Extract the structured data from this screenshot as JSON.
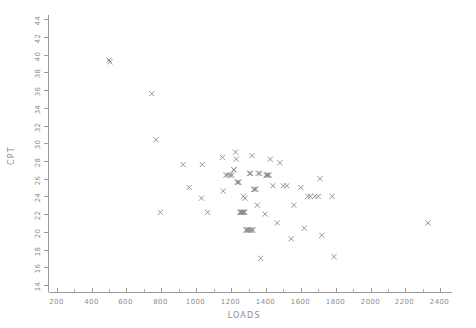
{
  "chart_data": {
    "type": "scatter",
    "title": "",
    "xlabel": "LOADS",
    "ylabel": "CPT",
    "xlim": [
      150,
      2530
    ],
    "ylim": [
      13.2,
      44.6
    ],
    "grid": false,
    "legend": null,
    "marker": "x",
    "marker_color": "#8a8a8a",
    "xticks": [
      200,
      400,
      600,
      800,
      1000,
      1200,
      1400,
      1600,
      1800,
      2000,
      2200,
      2400
    ],
    "xtick_labels": [
      "200",
      "400",
      "600",
      "800",
      "1000",
      "1200",
      "1400",
      "1600",
      "1800",
      "2000",
      "2200",
      "2400"
    ],
    "x_minor_step": 100,
    "yticks": [
      14,
      16,
      18,
      20,
      22,
      24,
      26,
      28,
      30,
      32,
      34,
      36,
      38,
      40,
      42,
      44
    ],
    "ytick_labels": [
      "14",
      "16",
      "18",
      "20",
      "22",
      "24",
      "26",
      "28",
      "30",
      "32",
      "34",
      "36",
      "38",
      "40",
      "42",
      "44"
    ],
    "y_tick_rotation": 90,
    "points": [
      {
        "x": 500,
        "y": 39.4
      },
      {
        "x": 505,
        "y": 39.2
      },
      {
        "x": 745,
        "y": 35.6
      },
      {
        "x": 770,
        "y": 30.4
      },
      {
        "x": 795,
        "y": 22.2
      },
      {
        "x": 925,
        "y": 27.6
      },
      {
        "x": 960,
        "y": 25.0
      },
      {
        "x": 1030,
        "y": 23.8
      },
      {
        "x": 1035,
        "y": 27.6
      },
      {
        "x": 1065,
        "y": 22.2
      },
      {
        "x": 1150,
        "y": 28.4
      },
      {
        "x": 1155,
        "y": 24.6
      },
      {
        "x": 1170,
        "y": 26.4
      },
      {
        "x": 1180,
        "y": 26.4
      },
      {
        "x": 1195,
        "y": 26.4
      },
      {
        "x": 1205,
        "y": 26.4
      },
      {
        "x": 1215,
        "y": 27.0
      },
      {
        "x": 1218,
        "y": 27.0
      },
      {
        "x": 1225,
        "y": 29.0
      },
      {
        "x": 1230,
        "y": 28.2
      },
      {
        "x": 1235,
        "y": 25.6
      },
      {
        "x": 1240,
        "y": 25.6
      },
      {
        "x": 1245,
        "y": 25.6
      },
      {
        "x": 1250,
        "y": 22.2
      },
      {
        "x": 1255,
        "y": 22.2
      },
      {
        "x": 1258,
        "y": 22.2
      },
      {
        "x": 1262,
        "y": 22.2
      },
      {
        "x": 1266,
        "y": 22.2
      },
      {
        "x": 1270,
        "y": 22.2
      },
      {
        "x": 1275,
        "y": 22.2
      },
      {
        "x": 1278,
        "y": 22.2
      },
      {
        "x": 1270,
        "y": 24.0
      },
      {
        "x": 1280,
        "y": 23.8
      },
      {
        "x": 1285,
        "y": 20.2
      },
      {
        "x": 1290,
        "y": 20.2
      },
      {
        "x": 1295,
        "y": 20.2
      },
      {
        "x": 1300,
        "y": 20.2
      },
      {
        "x": 1305,
        "y": 20.2
      },
      {
        "x": 1312,
        "y": 20.2
      },
      {
        "x": 1318,
        "y": 20.2
      },
      {
        "x": 1325,
        "y": 20.2
      },
      {
        "x": 1305,
        "y": 26.6
      },
      {
        "x": 1312,
        "y": 26.6
      },
      {
        "x": 1320,
        "y": 28.6
      },
      {
        "x": 1330,
        "y": 24.8
      },
      {
        "x": 1335,
        "y": 24.8
      },
      {
        "x": 1342,
        "y": 24.8
      },
      {
        "x": 1350,
        "y": 23.0
      },
      {
        "x": 1355,
        "y": 26.6
      },
      {
        "x": 1365,
        "y": 26.6
      },
      {
        "x": 1370,
        "y": 17.0
      },
      {
        "x": 1395,
        "y": 22.0
      },
      {
        "x": 1400,
        "y": 26.4
      },
      {
        "x": 1405,
        "y": 26.4
      },
      {
        "x": 1412,
        "y": 26.4
      },
      {
        "x": 1418,
        "y": 26.4
      },
      {
        "x": 1425,
        "y": 28.2
      },
      {
        "x": 1440,
        "y": 25.2
      },
      {
        "x": 1465,
        "y": 21.0
      },
      {
        "x": 1480,
        "y": 27.8
      },
      {
        "x": 1500,
        "y": 25.2
      },
      {
        "x": 1520,
        "y": 25.2
      },
      {
        "x": 1545,
        "y": 19.2
      },
      {
        "x": 1560,
        "y": 23.0
      },
      {
        "x": 1600,
        "y": 25.0
      },
      {
        "x": 1620,
        "y": 20.4
      },
      {
        "x": 1640,
        "y": 24.0
      },
      {
        "x": 1655,
        "y": 24.0
      },
      {
        "x": 1680,
        "y": 24.0
      },
      {
        "x": 1700,
        "y": 24.0
      },
      {
        "x": 1710,
        "y": 26.0
      },
      {
        "x": 1720,
        "y": 19.6
      },
      {
        "x": 1780,
        "y": 24.0
      },
      {
        "x": 1790,
        "y": 17.2
      },
      {
        "x": 2330,
        "y": 21.0
      }
    ]
  }
}
